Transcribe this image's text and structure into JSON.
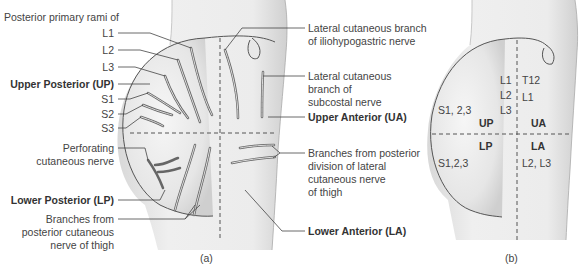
{
  "panel_a": {
    "caption": "(a)",
    "header": "Posterior primary rami of",
    "left_labels": {
      "l1": "L1",
      "l2": "L2",
      "l3": "L3",
      "up": "Upper Posterior (UP)",
      "s1": "S1",
      "s2": "S2",
      "s3": "S3",
      "perforating_1": "Perforating",
      "perforating_2": "cutaneous nerve",
      "lp": "Lower Posterior (LP)",
      "post_cut_1": "Branches from",
      "post_cut_2": "posterior cutaneous",
      "post_cut_3": "nerve of thigh"
    },
    "right_labels": {
      "iliohypo_1": "Lateral cutaneous branch",
      "iliohypo_2": "of iliohypogastric nerve",
      "subcostal_1": "Lateral cutaneous",
      "subcostal_2": "branch of",
      "subcostal_3": "subcostal nerve",
      "ua": "Upper Anterior (UA)",
      "lat_cut_1": "Branches from posterior",
      "lat_cut_2": "division of lateral",
      "lat_cut_3": "cutaneous nerve",
      "lat_cut_4": "of thigh",
      "la": "Lower Anterior (LA)"
    }
  },
  "panel_b": {
    "caption": "(b)",
    "up_upper_1": "L1",
    "up_upper_2": "L2",
    "up_upper_3": "L3",
    "ua_upper_1": "T12",
    "ua_upper_2": "L1",
    "up_left": "S1, 2,3",
    "up_quadrant": "UP",
    "ua_quadrant": "UA",
    "lp_quadrant": "LP",
    "la_quadrant": "LA",
    "lp_left": "S1,2,3",
    "la_right": "L2, L3"
  }
}
